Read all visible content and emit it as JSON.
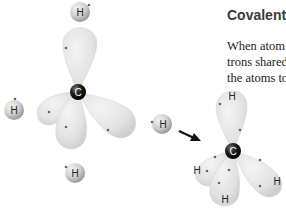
{
  "section": {
    "title": "Covalent",
    "text_lines": [
      "When atom",
      "trons shared",
      "the atoms to"
    ]
  },
  "diagram": {
    "left_molecule": {
      "center_label": "C",
      "hydrogens": [
        "H",
        "H",
        "H",
        "H"
      ]
    },
    "incoming_hydrogen": "H",
    "right_molecule": {
      "center_label": "C",
      "hydrogens": [
        "H",
        "H",
        "H",
        "H"
      ]
    },
    "colors": {
      "orbital": "#e4e4e4",
      "orbital_edge": "#c8c8c8",
      "carbon": "#1a1a1a",
      "hydrogen": "#d0d0d0",
      "arrow": "#111111",
      "electron": "#666666"
    }
  }
}
